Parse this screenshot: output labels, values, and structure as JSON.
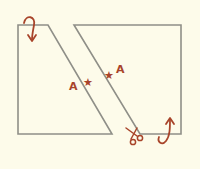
{
  "diagram": {
    "background": "#fdfbea",
    "line_color": "#8f8f88",
    "mark_color": "#a8442a",
    "shapes": [
      {
        "name": "left-piece",
        "points": "18,25 48,25 112,134 18,134"
      },
      {
        "name": "right-piece",
        "points": "74,25 181,25 181,134 140,134"
      }
    ],
    "labels": [
      {
        "text": "A",
        "x": 69,
        "y": 90
      },
      {
        "text": "A",
        "x": 116,
        "y": 73
      }
    ],
    "stars": [
      {
        "x": 87,
        "y": 82
      },
      {
        "x": 108,
        "y": 74
      }
    ],
    "annotations": [
      "rotate-arrow-top-left",
      "scissors",
      "rotate-arrow-bottom-right"
    ]
  }
}
